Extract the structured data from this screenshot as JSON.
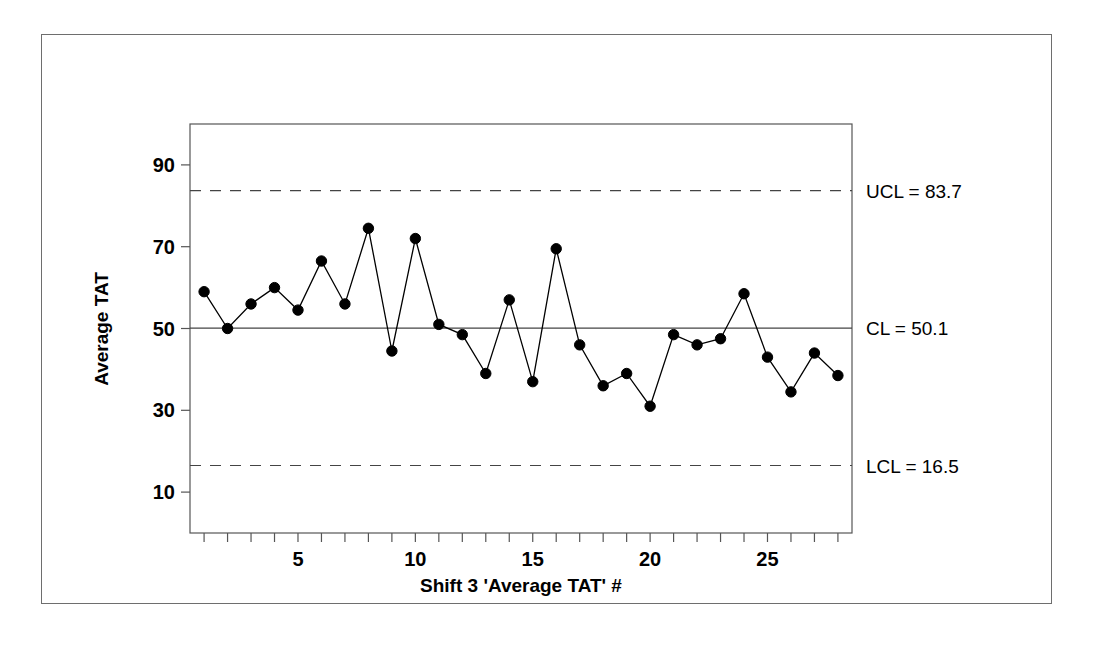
{
  "chart_data": {
    "type": "line",
    "title": "",
    "xlabel": "Shift 3 'Average TAT' #",
    "ylabel": "Average TAT",
    "x": [
      1,
      2,
      3,
      4,
      5,
      6,
      7,
      8,
      9,
      10,
      11,
      12,
      13,
      14,
      15,
      16,
      17,
      18,
      19,
      20,
      21,
      22,
      23,
      24,
      25,
      26,
      27,
      28
    ],
    "values": [
      59.0,
      50.0,
      56.0,
      60.0,
      54.5,
      66.5,
      56.0,
      74.5,
      44.5,
      72.0,
      51.0,
      48.5,
      39.0,
      57.0,
      37.0,
      69.5,
      46.0,
      36.0,
      39.0,
      31.0,
      48.5,
      46.0,
      47.5,
      58.5,
      43.0,
      34.5,
      44.0,
      38.5
    ],
    "series": [
      {
        "name": "Average TAT",
        "values": [
          59.0,
          50.0,
          56.0,
          60.0,
          54.5,
          66.5,
          56.0,
          74.5,
          44.5,
          72.0,
          51.0,
          48.5,
          39.0,
          57.0,
          37.0,
          69.5,
          46.0,
          36.0,
          39.0,
          31.0,
          48.5,
          46.0,
          47.5,
          58.5,
          43.0,
          34.5,
          44.0,
          38.5
        ]
      }
    ],
    "xlim": [
      0.4,
      28.6
    ],
    "ylim": [
      0,
      100
    ],
    "xticks": [
      1,
      2,
      3,
      4,
      5,
      6,
      7,
      8,
      9,
      10,
      11,
      12,
      13,
      14,
      15,
      16,
      17,
      18,
      19,
      20,
      21,
      22,
      23,
      24,
      25,
      26,
      27,
      28
    ],
    "xtick_labels": [
      {
        "value": 5,
        "label": "5"
      },
      {
        "value": 10,
        "label": "10"
      },
      {
        "value": 15,
        "label": "15"
      },
      {
        "value": 20,
        "label": "20"
      },
      {
        "value": 25,
        "label": "25"
      }
    ],
    "yticks": [
      10,
      30,
      50,
      70,
      90
    ],
    "ytick_labels": [
      "10",
      "30",
      "50",
      "70",
      "90"
    ],
    "grid": false,
    "legend": "none",
    "control_limits": {
      "ucl": {
        "value": 83.7,
        "label": "UCL = 83.7",
        "style": "dashed"
      },
      "cl": {
        "value": 50.1,
        "label": "CL = 50.1",
        "style": "solid"
      },
      "lcl": {
        "value": 16.5,
        "label": "LCL = 16.5",
        "style": "dashed"
      }
    },
    "marker": "filled-circle",
    "line_color": "#000000",
    "marker_color": "#000000"
  }
}
